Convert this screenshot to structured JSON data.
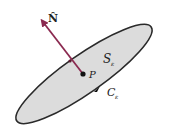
{
  "figure": {
    "type": "surface-with-normal",
    "labels": {
      "normal": "N̂",
      "surface": "S",
      "surface_sub": "ε",
      "point": "P",
      "curve": "C",
      "curve_sub": "ε"
    },
    "colors": {
      "surface_fill": "#dcdcdc",
      "surface_stroke": "#2a2a2a",
      "normal_vector": "#8b2a50",
      "text": "#222222"
    }
  }
}
